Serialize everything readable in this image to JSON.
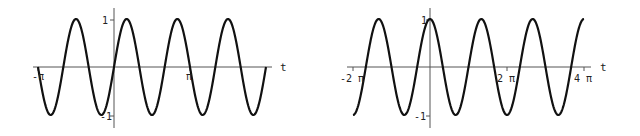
{
  "chart_data": [
    {
      "type": "line",
      "title": "",
      "function": "sin(3 t)",
      "xlabel": "t",
      "ylabel": "",
      "xlim_label": [
        "-π",
        "2π"
      ],
      "x_range": [
        -3.14159,
        6.28318
      ],
      "ylim": [
        -1,
        1
      ],
      "x_ticks": [
        {
          "value": -3.14159,
          "label": "-π"
        },
        {
          "value": 3.14159,
          "label": "π"
        }
      ],
      "y_ticks": [
        {
          "value": 1,
          "label": "1"
        },
        {
          "value": -1,
          "label": "-1"
        }
      ],
      "grid": false,
      "series": [
        {
          "name": "sin(3t)",
          "expr": "sin3t"
        }
      ]
    },
    {
      "type": "line",
      "title": "",
      "function": "cos(3 t / 2)",
      "xlabel": "t",
      "ylabel": "",
      "x_range": [
        -6.28318,
        12.56637
      ],
      "ylim": [
        -1,
        1
      ],
      "x_ticks": [
        {
          "value": -6.28318,
          "label": "-2 π"
        },
        {
          "value": 6.28318,
          "label": "2 π"
        },
        {
          "value": 12.56637,
          "label": "4 π"
        }
      ],
      "y_ticks": [
        {
          "value": 1,
          "label": "1"
        },
        {
          "value": -1,
          "label": "-1"
        }
      ],
      "grid": false,
      "series": [
        {
          "name": "cos(3t/2)",
          "expr": "cos1.5t"
        }
      ]
    }
  ],
  "plots": {
    "left": {
      "x_axis_label": "t",
      "tick_neg_pi": "-π",
      "tick_pi": "π",
      "y_tick_top": "1",
      "y_tick_bottom": "-1"
    },
    "right": {
      "x_axis_label": "t",
      "tick_neg_2pi": "-2 π",
      "tick_2pi": "2 π",
      "tick_4pi": "4 π",
      "y_tick_top": "1",
      "y_tick_bottom": "-1"
    }
  }
}
